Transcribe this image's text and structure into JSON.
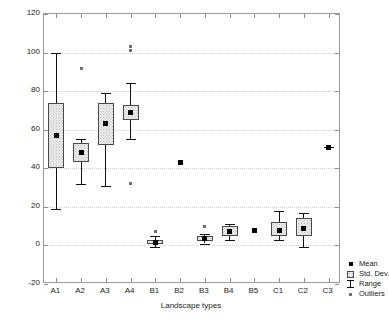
{
  "chart_data": {
    "type": "box",
    "title": "",
    "xlabel": "Landscape types",
    "ylabel": "HABITAT",
    "ylim": [
      -20,
      120
    ],
    "yticks": [
      -20,
      0,
      20,
      40,
      60,
      80,
      100,
      120
    ],
    "ytick_labels": [
      "-20",
      "0",
      "20",
      "40",
      "60",
      "80",
      "100",
      "120"
    ],
    "grid": true,
    "grid_axis": "y",
    "categories": [
      "A1",
      "A2",
      "A3",
      "A4",
      "B1",
      "B2",
      "B3",
      "B4",
      "B5",
      "C1",
      "C2",
      "C3"
    ],
    "legend_position": "right-bottom-outside",
    "legend": [
      {
        "key": "mean-marker",
        "label": "Mean"
      },
      {
        "key": "std-dev-box",
        "label": "Std. Dev."
      },
      {
        "key": "range-whisker",
        "label": "Range"
      },
      {
        "key": "outlier-marker",
        "label": "Outliers"
      }
    ],
    "series": [
      {
        "name": "A1",
        "mean": 57,
        "sd_low": 40,
        "sd_high": 74,
        "range_low": 19,
        "range_high": 100,
        "outliers": []
      },
      {
        "name": "A2",
        "mean": 48,
        "sd_low": 43,
        "sd_high": 53,
        "range_low": 32,
        "range_high": 55,
        "outliers": [
          92
        ]
      },
      {
        "name": "A3",
        "mean": 63,
        "sd_low": 52,
        "sd_high": 74,
        "range_low": 31,
        "range_high": 79,
        "outliers": []
      },
      {
        "name": "A4",
        "mean": 69,
        "sd_low": 65,
        "sd_high": 73,
        "range_low": 55,
        "range_high": 84,
        "outliers": [
          103,
          101,
          32
        ]
      },
      {
        "name": "B1",
        "mean": 1.5,
        "sd_low": 0.5,
        "sd_high": 3,
        "range_low": -1,
        "range_high": 5,
        "outliers": [
          7
        ]
      },
      {
        "name": "B2",
        "mean": 43,
        "sd_low": null,
        "sd_high": null,
        "range_low": null,
        "range_high": null,
        "outliers": []
      },
      {
        "name": "B3",
        "mean": 3.5,
        "sd_low": 2.5,
        "sd_high": 5,
        "range_low": 1,
        "range_high": 6,
        "outliers": [
          10
        ]
      },
      {
        "name": "B4",
        "mean": 7,
        "sd_low": 5,
        "sd_high": 10,
        "range_low": 3,
        "range_high": 11,
        "outliers": []
      },
      {
        "name": "B5",
        "mean": 7.5,
        "sd_low": null,
        "sd_high": null,
        "range_low": null,
        "range_high": null,
        "outliers": []
      },
      {
        "name": "C1",
        "mean": 8,
        "sd_low": 5,
        "sd_high": 12,
        "range_low": 3,
        "range_high": 18,
        "outliers": []
      },
      {
        "name": "C2",
        "mean": 9,
        "sd_low": 5,
        "sd_high": 14,
        "range_low": -1,
        "range_high": 17,
        "outliers": []
      },
      {
        "name": "C3",
        "mean": 51,
        "sd_low": null,
        "sd_high": null,
        "range_low": 51,
        "range_high": 51,
        "outliers": []
      }
    ]
  }
}
